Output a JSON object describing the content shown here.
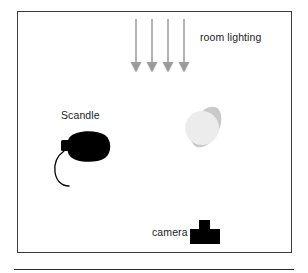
{
  "figure": {
    "background_color": "#ffffff",
    "frame": {
      "border_color": "#3b3b3b",
      "x": 17,
      "y": 11,
      "width": 275,
      "height": 242
    },
    "bottom_rule": {
      "color": "#2b2b2b",
      "x": 14,
      "y": 269,
      "width": 280
    }
  },
  "labels": {
    "room_lighting": "room lighting",
    "scandle": "Scandle",
    "camera": "camera"
  },
  "elements": {
    "room_lighting_arrows": {
      "name": "room-lighting-arrows",
      "count": 4,
      "color": "#9b9b9b",
      "direction": "down",
      "x_positions": [
        136,
        152,
        168,
        184
      ],
      "y_start": 19,
      "y_end": 72
    },
    "scandle_light": {
      "name": "scandle-light-source",
      "color": "#000000",
      "description": "black rounded light-head with small rectangular tab on left and curved power cable",
      "body_center": [
        92,
        146
      ],
      "cable_color": "#000000"
    },
    "illuminated_object": {
      "name": "illuminated-object",
      "disc_color": "#ececec",
      "halo_color": "#c9c9c9",
      "center": [
        204,
        127
      ]
    },
    "camera": {
      "name": "camera-icon",
      "color": "#000000",
      "shape": "t-shape",
      "x": 190,
      "y": 220,
      "width": 30,
      "height": 24
    }
  },
  "colors": {
    "ink": "#1b1b1b",
    "arrow_gray": "#9b9b9b",
    "frame_gray": "#3b3b3b",
    "halo_gray": "#c9c9c9",
    "disc_gray": "#ececec"
  }
}
